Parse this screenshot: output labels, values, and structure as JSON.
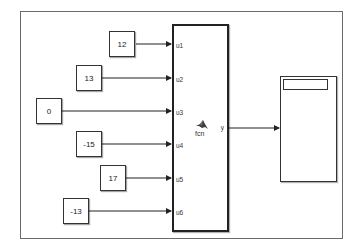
{
  "diagram": {
    "constants": [
      {
        "id": "const-1",
        "value": "12"
      },
      {
        "id": "const-2",
        "value": "13"
      },
      {
        "id": "const-3",
        "value": "0"
      },
      {
        "id": "const-4",
        "value": "-15"
      },
      {
        "id": "const-5",
        "value": "17"
      },
      {
        "id": "const-6",
        "value": "-13"
      }
    ],
    "function_block": {
      "name": "fcn",
      "inputs": [
        "u1",
        "u2",
        "u3",
        "u4",
        "u5",
        "u6"
      ],
      "output": "y",
      "icon": "matlab-logo-icon"
    },
    "display_block": {
      "icon": "display-icon"
    },
    "colors": {
      "line": "#222222",
      "frame": "#6a6a6a",
      "background": "#ffffff"
    }
  }
}
